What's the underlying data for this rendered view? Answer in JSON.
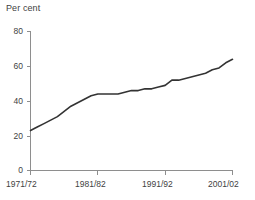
{
  "chart_data": {
    "type": "line",
    "title": "Per cent",
    "xlabel": "",
    "ylabel": "",
    "ylim": [
      0,
      80
    ],
    "yticks": [
      0,
      20,
      40,
      60,
      80
    ],
    "ytick_labels": [
      "0",
      "20",
      "40",
      "60",
      "80"
    ],
    "xtick_labels": [
      "1971/72",
      "1981/82",
      "1991/92",
      "2001/02"
    ],
    "xticks": [
      1971,
      1981,
      1991,
      2001
    ],
    "xlim": [
      1971,
      2001
    ],
    "grid": false,
    "legend": null,
    "legend_position": "none",
    "line_color": "#333333",
    "axis_color": "#8e8e8e",
    "x": [
      1971,
      1972,
      1973,
      1974,
      1975,
      1976,
      1977,
      1978,
      1979,
      1980,
      1981,
      1982,
      1983,
      1984,
      1985,
      1986,
      1987,
      1988,
      1989,
      1990,
      1991,
      1992,
      1993,
      1994,
      1995,
      1996,
      1997,
      1998,
      1999,
      2000,
      2001
    ],
    "x_categories": [
      "1971/72",
      "1972/73",
      "1973/74",
      "1974/75",
      "1975/76",
      "1976/77",
      "1977/78",
      "1978/79",
      "1979/80",
      "1980/81",
      "1981/82",
      "1982/83",
      "1983/84",
      "1984/85",
      "1985/86",
      "1986/87",
      "1987/88",
      "1988/89",
      "1989/90",
      "1990/91",
      "1991/92",
      "1992/93",
      "1993/94",
      "1994/95",
      "1995/96",
      "1996/97",
      "1997/98",
      "1998/99",
      "1999/00",
      "2000/01",
      "2001/02"
    ],
    "values": [
      23,
      25,
      27,
      29,
      31,
      34,
      37,
      39,
      41,
      43,
      44,
      44,
      44,
      44,
      45,
      46,
      46,
      47,
      47,
      48,
      49,
      52,
      52,
      53,
      54,
      55,
      56,
      58,
      59,
      62,
      64
    ],
    "series": [
      {
        "name": "Per cent",
        "values": [
          23,
          25,
          27,
          29,
          31,
          34,
          37,
          39,
          41,
          43,
          44,
          44,
          44,
          44,
          45,
          46,
          46,
          47,
          47,
          48,
          49,
          52,
          52,
          53,
          54,
          55,
          56,
          58,
          59,
          62,
          64
        ]
      }
    ]
  },
  "axes": {
    "y_title": "Per cent"
  }
}
